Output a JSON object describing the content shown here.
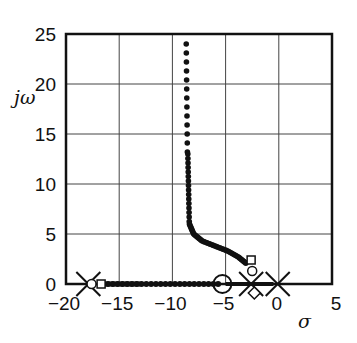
{
  "chart_data": {
    "type": "scatter",
    "title": "",
    "xlabel": "σ",
    "ylabel": "jω",
    "xlim": [
      -20,
      5
    ],
    "ylim": [
      0,
      25
    ],
    "grid": true,
    "xticks": [
      "-20",
      "-15",
      "-10",
      "-5",
      "0",
      "5"
    ],
    "yticks": [
      "0",
      "5",
      "10",
      "15",
      "20",
      "25"
    ],
    "poles": [
      [
        -17.9,
        0
      ],
      [
        -2.6,
        0
      ],
      [
        -0.1,
        0
      ]
    ],
    "zeros": [
      [
        -5.3,
        0
      ]
    ],
    "squares": [
      [
        -16.7,
        0
      ],
      [
        -2.6,
        2.4
      ]
    ],
    "diamonds": [
      [
        -2.3,
        -0.3
      ]
    ],
    "small_circles": [
      [
        -17.6,
        0
      ],
      [
        -2.5,
        1.3
      ]
    ],
    "locus_vertical": {
      "x_start": -8.7,
      "x_end": -8.5,
      "y_top": 24,
      "y_bottom": 6
    },
    "locus_curve": [
      [
        -8.4,
        6
      ],
      [
        -8.0,
        5
      ],
      [
        -7.2,
        4.3
      ],
      [
        -6,
        3.8
      ],
      [
        -4.8,
        3.3
      ],
      [
        -3.8,
        2.7
      ],
      [
        -3,
        2.0
      ]
    ],
    "locus_real_axis": {
      "from": -16.5,
      "to": -5.5
    }
  },
  "labels": {
    "y_axis": "jω",
    "x_axis": "σ"
  }
}
